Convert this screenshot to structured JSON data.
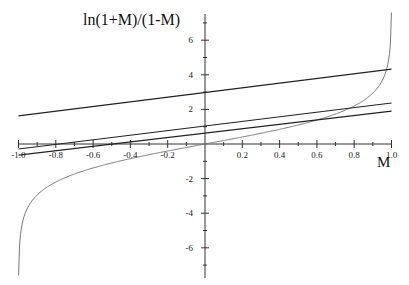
{
  "chart_data": {
    "type": "line",
    "title": "",
    "xlabel": "M",
    "ylabel": "ln(1+M)/(1-M)",
    "xlim": [
      -1.0,
      1.0
    ],
    "ylim": [
      -7.6,
      7.6
    ],
    "grid": false,
    "legend": null,
    "x_ticks": [
      "-1.0",
      "-0.8",
      "-0.6",
      "-0.4",
      "-0.2",
      "0.2",
      "0.4",
      "0.6",
      "0.8",
      "1.0"
    ],
    "y_ticks": [
      "6",
      "4",
      "2",
      "-2",
      "-4",
      "-6"
    ],
    "series": [
      {
        "name": "ln((1+M)/(1-M))",
        "kind": "curve",
        "x": [
          -0.9995,
          -0.99,
          -0.95,
          -0.9,
          -0.8,
          -0.6,
          -0.4,
          -0.2,
          0,
          0.2,
          0.4,
          0.6,
          0.8,
          0.9,
          0.95,
          0.99,
          0.9995
        ],
        "y": [
          -7.6,
          -5.29,
          -3.66,
          -2.94,
          -2.2,
          -1.39,
          -0.85,
          -0.41,
          0,
          0.41,
          0.85,
          1.39,
          2.2,
          2.94,
          3.66,
          5.29,
          7.6
        ]
      },
      {
        "name": "line A",
        "kind": "line",
        "x": [
          -1.0,
          1.0
        ],
        "y": [
          1.62,
          4.33
        ]
      },
      {
        "name": "line B",
        "kind": "line",
        "x": [
          -1.0,
          1.0
        ],
        "y": [
          -0.29,
          2.37
        ]
      },
      {
        "name": "line C",
        "kind": "line",
        "x": [
          -1.0,
          1.0
        ],
        "y": [
          -0.64,
          1.9
        ]
      }
    ]
  },
  "labels": {
    "ylabel": "ln(1+M)/(1-M)",
    "xlabel": "M"
  },
  "colors": {
    "axis": "#333333",
    "curve": "#777777",
    "lines": "#222222"
  }
}
